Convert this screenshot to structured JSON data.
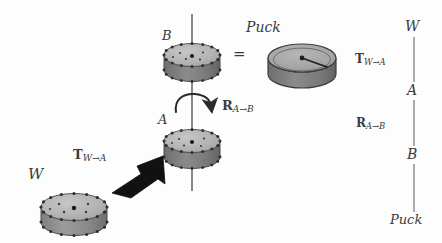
{
  "figure": {
    "type": "frame-transform-diagram",
    "background_color": "#fdfdfd",
    "ink_color": "#3a3a3a"
  },
  "labels": {
    "frame_w_left": "W",
    "frame_b_top": "B",
    "frame_a_middle": "A",
    "puck_title": "Puck",
    "equals": "=",
    "transform_t_symbol": "T",
    "transform_t_subscript": "W→A",
    "transform_r_symbol": "R",
    "transform_r_subscript": "A→B"
  },
  "chain": {
    "nodes": [
      "W",
      "A",
      "B",
      "Puck"
    ],
    "edges": [
      {
        "symbol": "T",
        "subscript": "W→A",
        "from": "W",
        "to": "A"
      },
      {
        "symbol": "R",
        "subscript": "A→B",
        "from": "A",
        "to": "B"
      },
      {
        "symbol": "",
        "subscript": "",
        "from": "B",
        "to": "Puck"
      }
    ]
  },
  "pucks": [
    {
      "id": "puck-w",
      "label": "W",
      "top_face_color": "#b4b4b4",
      "side_color": "#9a9a9a",
      "edge_color": "#4a4a4a",
      "rim_dots": 16,
      "interior_dots": 5
    },
    {
      "id": "puck-a",
      "label": "A",
      "top_face_color": "#b8b8b8",
      "side_color": "#8f8f8f",
      "edge_color": "#4a4a4a",
      "rim_dots": 16,
      "interior_dots": 5
    },
    {
      "id": "puck-b",
      "label": "B",
      "top_face_color": "#b8b8b8",
      "side_color": "#8f8f8f",
      "edge_color": "#4a4a4a",
      "rim_dots": 16,
      "interior_dots": 5
    },
    {
      "id": "puck-model",
      "label": "Puck",
      "top_face_color": "#a8a8a8",
      "side_color": "#7e7e7e",
      "edge_color": "#3c3c3c",
      "rim_dots": 0,
      "interior_dots": 0
    }
  ],
  "annotations": {
    "rotation_axis": "vertical spin axis through pucks A and B",
    "rotation_arc": "curved arrow about the spin axis",
    "block_arrow": "thick black 3D arrow from frame W to frame A"
  }
}
